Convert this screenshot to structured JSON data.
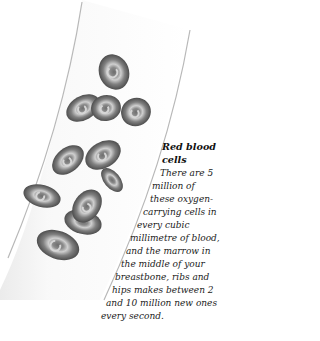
{
  "illustration": {
    "subject": "red blood cells flowing in a blood vessel",
    "cell_count": 10,
    "colors": {
      "cell_fill": "#7a7a7a",
      "cell_rim": "#5a5a5a",
      "cell_highlight": "#c8c8c8",
      "vessel_wall": "#b0b0b0",
      "vessel_fill": "#f3f3f3"
    }
  },
  "caption": {
    "title_line1": "Red blood",
    "title_line2": "cells",
    "lines": [
      "There are 5",
      "million of",
      "these oxygen-",
      "carrying cells in",
      "every cubic",
      "millimetre of blood,",
      "and the marrow in",
      "the middle of your",
      "breastbone, ribs and",
      "hips makes between 2",
      "and 10 million new ones",
      "every second."
    ]
  }
}
